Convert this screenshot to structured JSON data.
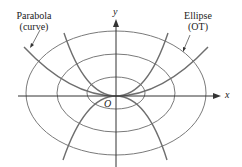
{
  "diagram": {
    "labels": {
      "parabola_line1": "Parabola",
      "parabola_line2": "(curve)",
      "ellipse_line1": "Ellipse",
      "ellipse_line2": "(OT)",
      "x_axis": "x",
      "y_axis": "y",
      "origin": "O"
    },
    "colors": {
      "ellipse": "#7a7a7a",
      "parabola": "#6e6e6e",
      "axis": "#333333",
      "text": "#222222"
    },
    "ellipses": [
      {
        "rx": 29,
        "ry": 17
      },
      {
        "rx": 59,
        "ry": 39
      },
      {
        "rx": 90,
        "ry": 62
      }
    ],
    "parabola_families": {
      "count": 4,
      "description": "y = kx^2 curves through origin, two opening up and two opening down"
    }
  }
}
